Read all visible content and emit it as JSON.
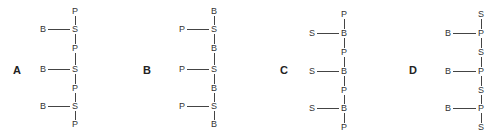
{
  "figure": {
    "panels": [
      {
        "label": "A",
        "label_pos": [
          17,
          70
        ],
        "column_x": 75,
        "branch_x": 43,
        "backbone": [
          "P",
          "S",
          "P",
          "S",
          "P",
          "S",
          "P"
        ],
        "backbone_y": [
          11,
          29,
          48,
          69,
          88,
          106,
          124
        ],
        "branches": [
          {
            "atom": "B",
            "attach_index": 1
          },
          {
            "atom": "B",
            "attach_index": 3
          },
          {
            "atom": "B",
            "attach_index": 5
          }
        ]
      },
      {
        "label": "B",
        "label_pos": [
          147,
          70
        ],
        "column_x": 214,
        "branch_x": 182,
        "backbone": [
          "B",
          "S",
          "B",
          "S",
          "B",
          "S",
          "B"
        ],
        "backbone_y": [
          11,
          29,
          48,
          69,
          88,
          106,
          124
        ],
        "branches": [
          {
            "atom": "P",
            "attach_index": 1
          },
          {
            "atom": "P",
            "attach_index": 3
          },
          {
            "atom": "P",
            "attach_index": 5
          }
        ]
      },
      {
        "label": "C",
        "label_pos": [
          284,
          70
        ],
        "column_x": 344,
        "branch_x": 312,
        "backbone": [
          "P",
          "B",
          "P",
          "B",
          "P",
          "B",
          "P"
        ],
        "backbone_y": [
          14,
          33,
          52,
          71,
          90,
          108,
          127
        ],
        "branches": [
          {
            "atom": "S",
            "attach_index": 1
          },
          {
            "atom": "S",
            "attach_index": 3
          },
          {
            "atom": "S",
            "attach_index": 5
          }
        ]
      },
      {
        "label": "D",
        "label_pos": [
          413,
          70
        ],
        "column_x": 481,
        "branch_x": 448,
        "backbone": [
          "S",
          "P",
          "S",
          "P",
          "S",
          "P",
          "S"
        ],
        "backbone_y": [
          14,
          33,
          52,
          71,
          90,
          108,
          127
        ],
        "branches": [
          {
            "atom": "B",
            "attach_index": 1
          },
          {
            "atom": "B",
            "attach_index": 3
          },
          {
            "atom": "B",
            "attach_index": 5
          }
        ]
      }
    ]
  }
}
